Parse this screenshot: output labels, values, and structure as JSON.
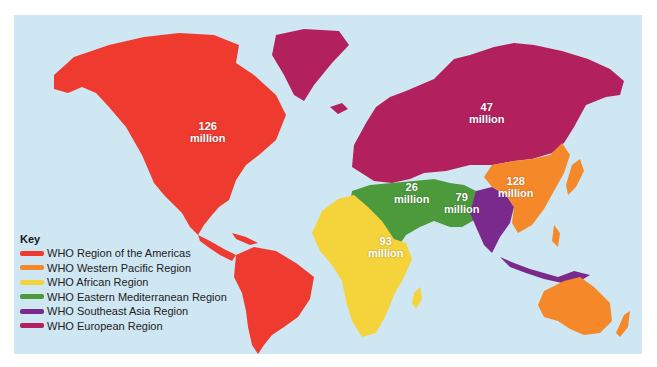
{
  "legend": {
    "title": "Key",
    "items": [
      {
        "label": "WHO Region of the Americas",
        "color": "#ef3a2f"
      },
      {
        "label": "WHO Western Pacific Region",
        "color": "#f5892a"
      },
      {
        "label": "WHO African Region",
        "color": "#f5d33b"
      },
      {
        "label": "WHO Eastern Mediterranean Region",
        "color": "#4c9a3c"
      },
      {
        "label": "WHO Southeast Asia Region",
        "color": "#7a2a8c"
      },
      {
        "label": "WHO European Region",
        "color": "#b3205e"
      }
    ]
  },
  "regions": {
    "americas": {
      "value": "126",
      "unit": "million"
    },
    "europe": {
      "value": "47",
      "unit": "million"
    },
    "western_pacific": {
      "value": "128",
      "unit": "million"
    },
    "eastern_mediterranean": {
      "value": "26",
      "unit": "million"
    },
    "southeast_asia": {
      "value": "79",
      "unit": "million"
    },
    "africa": {
      "value": "93",
      "unit": "million"
    }
  },
  "colors": {
    "ocean": "#cfe6f3",
    "americas": "#ef3a2f",
    "europe": "#b3205e",
    "western_pacific": "#f5892a",
    "africa": "#f5d33b",
    "eastern_mediterranean": "#4c9a3c",
    "southeast_asia": "#7a2a8c"
  }
}
